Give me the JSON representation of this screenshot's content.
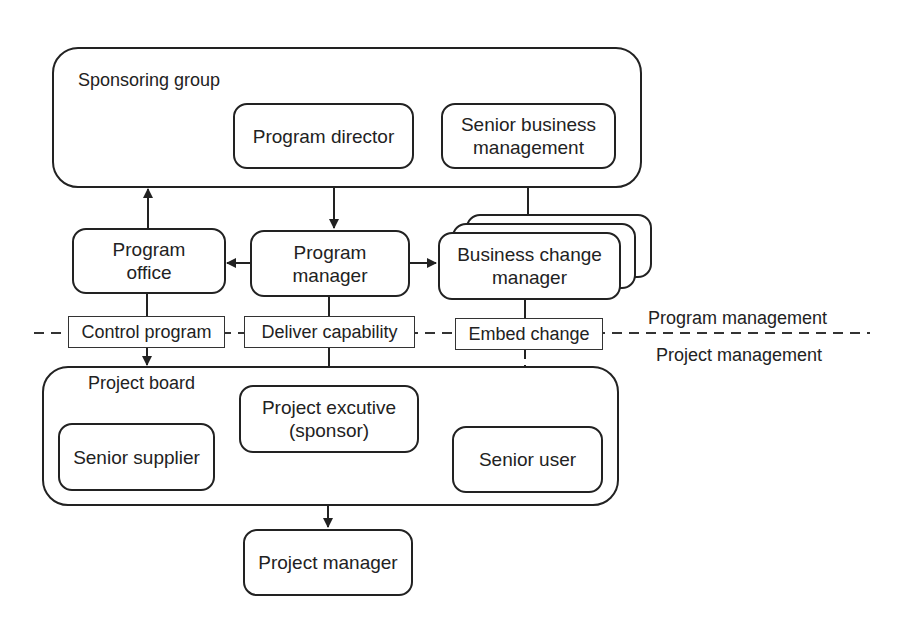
{
  "diagram": {
    "groups": {
      "sponsoring_group": "Sponsoring group",
      "project_board": "Project board"
    },
    "nodes": {
      "program_director": "Program director",
      "senior_business_management": [
        "Senior business",
        "management"
      ],
      "program_office": [
        "Program",
        "office"
      ],
      "program_manager": [
        "Program",
        "manager"
      ],
      "business_change_manager": [
        "Business change",
        "manager"
      ],
      "project_executive": [
        "Project excutive",
        "(sponsor)"
      ],
      "senior_supplier": "Senior supplier",
      "senior_user": "Senior user",
      "project_manager": "Project manager"
    },
    "connector_labels": {
      "control_program": "Control program",
      "deliver_capability": "Deliver capability",
      "embed_change": "Embed change"
    },
    "boundary": {
      "above": "Program management",
      "below": "Project management"
    },
    "edges": [
      {
        "from": "Program director",
        "to": "Program manager",
        "style": "solid"
      },
      {
        "from": "Senior business management",
        "to": "Business change manager",
        "style": "solid"
      },
      {
        "from": "Program office",
        "to": "Sponsoring group",
        "style": "solid"
      },
      {
        "from": "Program manager",
        "to": "Program office",
        "style": "solid"
      },
      {
        "from": "Program manager",
        "to": "Business change manager",
        "style": "solid"
      },
      {
        "from": "Program office",
        "to": "Project board",
        "label": "Control program",
        "style": "solid"
      },
      {
        "from": "Program manager",
        "to": "Project excutive (sponsor)",
        "label": "Deliver capability",
        "style": "solid"
      },
      {
        "from": "Business change manager",
        "to": "Senior user",
        "label": "Embed change",
        "style": "dashed"
      },
      {
        "from": "Project board",
        "to": "Project manager",
        "style": "solid"
      }
    ]
  }
}
